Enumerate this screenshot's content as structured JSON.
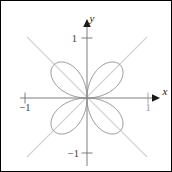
{
  "figure": {
    "background_color": "#ffffff",
    "border_color": "#000000",
    "width": 172,
    "height": 172
  },
  "chart_data": {
    "type": "line",
    "plot_kind": "polar-rose",
    "title": "",
    "subtitle": "",
    "xlabel": "x",
    "ylabel": "y",
    "equation_form": "r = sin(2*theta)",
    "petal_count": 4,
    "petal_max_radius": 0.78,
    "petal_orientations_deg": [
      45,
      135,
      225,
      315
    ],
    "xlim": [
      -1.35,
      1.35
    ],
    "ylim": [
      -1.35,
      1.35
    ],
    "grid": false,
    "legend": null,
    "curve_color": "#8a8a8a",
    "curve_width": 0.9,
    "axis_color": "#6f6f6f",
    "guide_color": "#d2d2d2",
    "guides": [
      {
        "name": "diagonal-positive",
        "equation": "y = x",
        "from": [
          -0.92,
          -0.92
        ],
        "to": [
          0.92,
          0.92
        ]
      },
      {
        "name": "diagonal-negative",
        "equation": "y = -x",
        "from": [
          -0.92,
          0.92
        ],
        "to": [
          0.92,
          -0.92
        ]
      }
    ],
    "x_axis": {
      "label": "x",
      "ticks": [
        {
          "value": -1,
          "label": "-1",
          "position": "below"
        },
        {
          "value": 1,
          "label": "1",
          "position": "below"
        }
      ],
      "arrow": "right"
    },
    "y_axis": {
      "label": "y",
      "ticks": [
        {
          "value": 1,
          "label": "1",
          "position": "left"
        },
        {
          "value": -1,
          "label": "-1",
          "position": "left"
        }
      ],
      "arrow": "up"
    },
    "series": [
      {
        "name": "rose-curve",
        "color": "#8a8a8a",
        "theta_step_deg": 1,
        "r_amplitude": 0.78
      }
    ]
  },
  "labels": {
    "y_axis_label": "y",
    "x_axis_label": "x",
    "tick_y_positive_one": "1",
    "tick_y_negative_one": "−1",
    "tick_x_negative_one": "−1",
    "tick_x_positive_one": "1"
  }
}
